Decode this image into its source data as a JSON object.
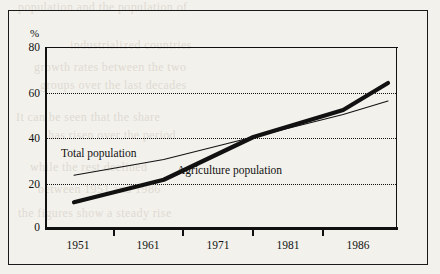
{
  "page": {
    "background_color": "#f3f1ec",
    "ink_color": "#111111",
    "bleed_through_lines": [
      {
        "text": "population and the population of",
        "x": 18,
        "y": 0
      },
      {
        "text": "industrialized countries",
        "x": 70,
        "y": 38
      },
      {
        "text": "growth rates between the two",
        "x": 34,
        "y": 60
      },
      {
        "text": "groups over the last decades",
        "x": 40,
        "y": 78
      },
      {
        "text": "It can be seen that the share",
        "x": 16,
        "y": 110
      },
      {
        "text": "has risen over the period",
        "x": 48,
        "y": 128
      },
      {
        "text": "while the rest declined",
        "x": 30,
        "y": 160
      },
      {
        "text": "between 1951 and 1986",
        "x": 38,
        "y": 182
      },
      {
        "text": "the figures show a steady rise",
        "x": 18,
        "y": 206
      }
    ]
  },
  "chart_data": {
    "type": "line",
    "title": "",
    "xlabel": "",
    "ylabel": "%",
    "ylim": [
      0,
      80
    ],
    "yticks": [
      0,
      20,
      40,
      60,
      80
    ],
    "ytick_labels": [
      "0",
      "20",
      "40",
      "60",
      "80"
    ],
    "gridlines_y": [
      20,
      40,
      60
    ],
    "grid": "dotted-horizontal",
    "xtick_labels": [
      "1951",
      "1961",
      "1971",
      "1981",
      "1986"
    ],
    "x": [
      1951,
      1961,
      1971,
      1981,
      1986
    ],
    "legend_position": "inline-annotations",
    "series": [
      {
        "name": "Total population",
        "style": "thin",
        "values": [
          23,
          30,
          40,
          50,
          56
        ]
      },
      {
        "name": "Agriculture population",
        "style": "thick",
        "values": [
          11,
          21,
          40,
          52,
          64
        ]
      }
    ],
    "annotations": [
      {
        "text": "Total population",
        "x": 1954.5,
        "y": 32
      },
      {
        "text": "Agriculture population",
        "x": 1968.5,
        "y": 27
      }
    ]
  },
  "axis": {
    "percent_symbol": "%"
  }
}
